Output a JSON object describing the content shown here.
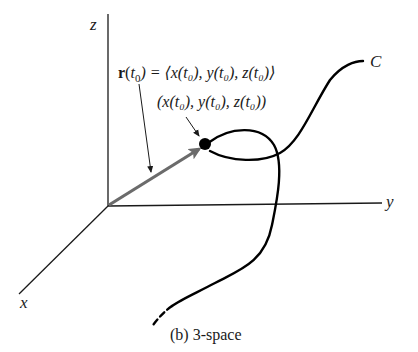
{
  "figure": {
    "caption": "(b) 3-space",
    "axes": {
      "x_label": "x",
      "y_label": "y",
      "z_label": "z"
    },
    "curve_label": "C",
    "vector_label": {
      "bold": "r",
      "arg_open": "(",
      "t": "t",
      "sub": "0",
      "rest": ") = ⟨x(t₀), y(t₀), z(t₀)⟩"
    },
    "point_label": "(x(t₀), y(t₀), z(t₀))",
    "colors": {
      "axis": "#1a1a1a",
      "vector": "#6b6b6b",
      "curve": "#000000",
      "point": "#000000"
    }
  }
}
